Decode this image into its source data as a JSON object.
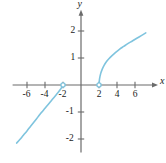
{
  "figure": {
    "width": 166,
    "height": 163,
    "background": "#ffffff"
  },
  "chart_data": {
    "type": "line",
    "title": "",
    "xlabel": "x",
    "ylabel": "y",
    "xlim": [
      -7.6,
      8.0
    ],
    "ylim": [
      -2.5,
      2.6
    ],
    "grid": false,
    "legend": null,
    "axis_color": "#6b6b6b",
    "curve_color": "#7fc4de",
    "text_color": "#1a1a1a",
    "xticks": [
      -6,
      -4,
      -2,
      2,
      4,
      6
    ],
    "xtick_labels": [
      "-6",
      "-4",
      "-2",
      "2",
      "4",
      "6"
    ],
    "yticks": [
      2,
      1,
      -1,
      -2
    ],
    "ytick_labels": [
      "2",
      "1",
      "-1",
      "-2"
    ],
    "series": [
      {
        "name": "left-branch",
        "comment": "cube-root style branch for x < -2, ends with open circle at (-2, 0)",
        "points": [
          [
            -7.15,
            -2.15
          ],
          [
            -6.8,
            -2.02
          ],
          [
            -6.4,
            -1.86
          ],
          [
            -6.0,
            -1.7
          ],
          [
            -5.6,
            -1.53
          ],
          [
            -5.2,
            -1.36
          ],
          [
            -4.8,
            -1.19
          ],
          [
            -4.4,
            -1.02
          ],
          [
            -4.0,
            -0.86
          ],
          [
            -3.6,
            -0.7
          ],
          [
            -3.3,
            -0.58
          ],
          [
            -3.0,
            -0.46
          ],
          [
            -2.75,
            -0.36
          ],
          [
            -2.55,
            -0.28
          ],
          [
            -2.4,
            -0.21
          ],
          [
            -2.28,
            -0.155
          ],
          [
            -2.18,
            -0.11
          ],
          [
            -2.1,
            -0.065
          ],
          [
            -2.04,
            -0.03
          ],
          [
            -2.0,
            0.0
          ]
        ]
      },
      {
        "name": "right-branch",
        "comment": "cube-root style branch for x > 2, starts with open circle at (2, 0)",
        "points": [
          [
            2.0,
            0.0
          ],
          [
            2.04,
            0.17
          ],
          [
            2.1,
            0.3
          ],
          [
            2.2,
            0.44
          ],
          [
            2.35,
            0.58
          ],
          [
            2.55,
            0.72
          ],
          [
            2.8,
            0.85
          ],
          [
            3.1,
            0.97
          ],
          [
            3.45,
            1.09
          ],
          [
            3.85,
            1.21
          ],
          [
            4.3,
            1.33
          ],
          [
            4.75,
            1.43
          ],
          [
            5.2,
            1.53
          ],
          [
            5.7,
            1.63
          ],
          [
            6.2,
            1.73
          ],
          [
            6.7,
            1.83
          ],
          [
            7.2,
            1.93
          ]
        ]
      }
    ],
    "open_points": [
      {
        "name": "open-circle-left",
        "x": -2,
        "y": 0
      },
      {
        "name": "open-circle-right",
        "x": 2,
        "y": 0
      }
    ]
  }
}
